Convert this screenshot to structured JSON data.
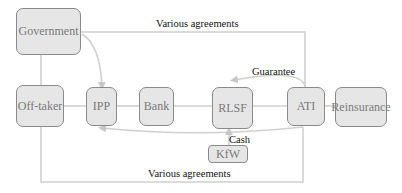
{
  "nodes": {
    "government": "Government",
    "offtaker": "Off-taker",
    "ipp": "IPP",
    "bank": "Bank",
    "rlsf": "RLSF",
    "ati": "ATI",
    "reinsurance": "Reinsurance",
    "kfw": "KfW"
  },
  "edge_labels": {
    "top_agreements": "Various agreements",
    "bottom_agreements": "Various agreements",
    "guarantee": "Guarantee",
    "cash": "Cash"
  },
  "colors": {
    "box_fill": "#e6e6e6",
    "box_border": "#8a8a8a",
    "line": "#cfcfcf",
    "node_text": "#7a7a7a",
    "label_text": "#111111"
  }
}
